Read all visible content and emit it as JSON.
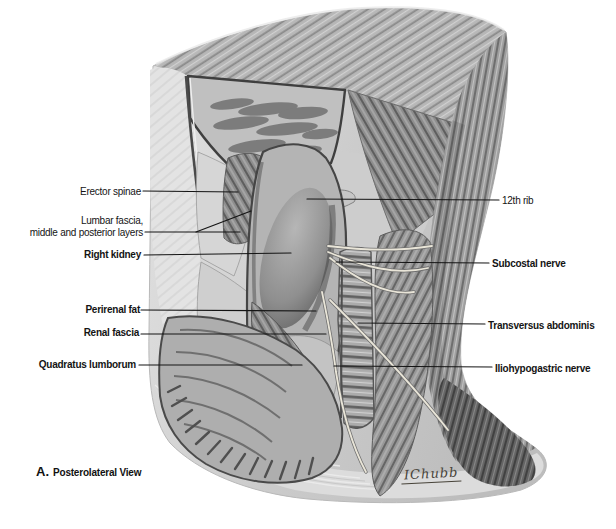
{
  "figure": {
    "caption": {
      "letter": "A.",
      "title": "Posterolateral View"
    },
    "signature": "IChubb"
  },
  "labels": {
    "left": {
      "erector_spinae": "Erector spinae",
      "lumbar_fascia_line1": "Lumbar fascia,",
      "lumbar_fascia_line2": "middle and posterior layers",
      "right_kidney": "Right kidney",
      "perirenal_fat": "Perirenal fat",
      "renal_fascia": "Renal fascia",
      "quadratus_lumborum": "Quadratus lumborum"
    },
    "right": {
      "twelfth_rib": "12th rib",
      "subcostal_nerve": "Subcostal nerve",
      "transversus_abdominis": "Transversus abdominis",
      "iliohypogastric_nerve": "Iliohypogastric nerve"
    }
  },
  "colors": {
    "background": "#ffffff",
    "label_text": "#141414",
    "leader_line": "#141414",
    "signature_ink": "#474339"
  }
}
